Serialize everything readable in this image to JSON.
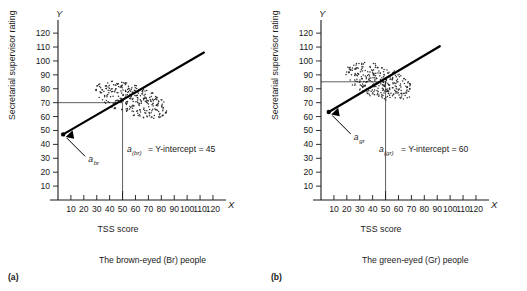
{
  "figure": {
    "panels": [
      {
        "key": "a",
        "panel_letter": "(a)",
        "caption": "The brown-eyed (Br) people",
        "axis_letter_x": "X",
        "axis_letter_y": "Y",
        "xlabel": "TSS score",
        "ylabel": "Secretarial supervisor rating",
        "annotation": {
          "symbol": "a",
          "subscript": "(br)",
          "text": "=  Y-intercept = 45"
        },
        "arrow_label": {
          "symbol": "a",
          "subscript": "br"
        },
        "chart_data": {
          "type": "scatter",
          "title": "The brown-eyed (Br) people",
          "xlabel": "TSS score",
          "ylabel": "Secretarial supervisor rating",
          "xlim": [
            0,
            127
          ],
          "ylim": [
            0,
            128
          ],
          "xticks": [
            10,
            20,
            30,
            40,
            50,
            60,
            70,
            80,
            90,
            100,
            110,
            120
          ],
          "yticks": [
            10,
            20,
            30,
            40,
            50,
            60,
            70,
            80,
            90,
            100,
            110,
            120
          ],
          "grid": false,
          "legend": "none",
          "regression": {
            "intercept": 45,
            "slope": 0.54,
            "x_start": 4,
            "x_end": 113
          },
          "y_intercept": 45,
          "guide_lines": {
            "x": 50,
            "y": 70
          },
          "cloud": {
            "center_x": 57,
            "center_y": 72,
            "semi_major": 29,
            "semi_minor": 11,
            "angle_deg": -17,
            "n_points": 300
          }
        }
      },
      {
        "key": "b",
        "panel_letter": "(b)",
        "caption": "The green-eyed (Gr) people",
        "axis_letter_x": "X",
        "axis_letter_y": "Y",
        "xlabel": "TSS score",
        "ylabel": "Secretarial supervisor rating",
        "annotation": {
          "symbol": "a",
          "subscript": "(gr)",
          "text": "=  Y-intercept = 60"
        },
        "arrow_label": {
          "symbol": "a",
          "subscript": "gr"
        },
        "chart_data": {
          "type": "scatter",
          "title": "The green-eyed (Gr) people",
          "xlabel": "TSS score",
          "ylabel": "Secretarial supervisor rating",
          "xlim": [
            0,
            127
          ],
          "ylim": [
            0,
            128
          ],
          "xticks": [
            10,
            20,
            30,
            40,
            50,
            60,
            70,
            80,
            90,
            100,
            110,
            120
          ],
          "yticks": [
            10,
            20,
            30,
            40,
            50,
            60,
            70,
            80,
            90,
            100,
            110,
            120
          ],
          "grid": false,
          "legend": "none",
          "regression": {
            "intercept": 60,
            "slope": 0.55,
            "x_start": 6,
            "x_end": 92
          },
          "y_intercept": 60,
          "guide_lines": {
            "x": 50,
            "y": 85
          },
          "cloud": {
            "center_x": 45,
            "center_y": 85,
            "semi_major": 27,
            "semi_minor": 12,
            "angle_deg": -17,
            "n_points": 300
          }
        }
      }
    ]
  }
}
